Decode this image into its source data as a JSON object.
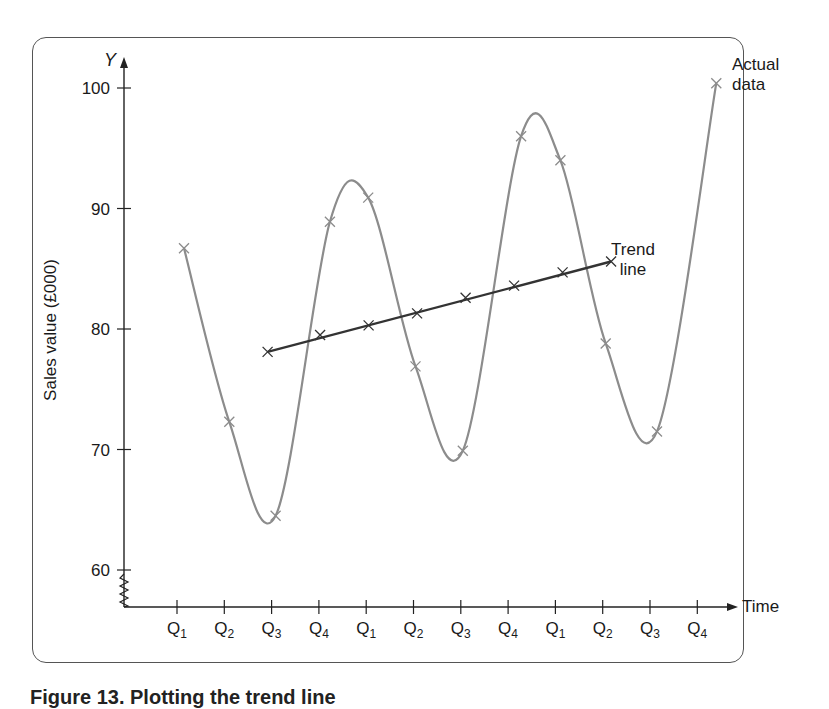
{
  "chart_data": {
    "type": "line",
    "title": "",
    "xlabel": "Time",
    "ylabel": "Sales value (£000)",
    "y_axis_symbol": "Y",
    "ylim": [
      57,
      102
    ],
    "yticks": [
      60,
      70,
      80,
      90,
      100
    ],
    "y_axis_break": true,
    "categories": [
      "Q1",
      "Q2",
      "Q3",
      "Q4",
      "Q1",
      "Q2",
      "Q3",
      "Q4",
      "Q1",
      "Q2",
      "Q3",
      "Q4"
    ],
    "grid": false,
    "series": [
      {
        "name": "Actual data",
        "style": "smooth curve with x markers",
        "color": "#8c8c8c",
        "values": [
          86.7,
          72.3,
          64.5,
          88.9,
          90.9,
          76.9,
          69.9,
          96.0,
          94.0,
          78.8,
          71.5,
          100.4
        ]
      },
      {
        "name": "Trend line",
        "style": "straight line with x markers",
        "color": "#333333",
        "start_index": 2,
        "values": [
          null,
          null,
          78.1,
          79.5,
          80.3,
          81.3,
          82.6,
          83.6,
          84.7,
          85.6,
          null,
          null
        ]
      }
    ],
    "annotations": [
      {
        "text": "Actual data",
        "near": "last actual data point (Q4, ~100)"
      },
      {
        "text": "Trend line",
        "near": "end of trend line (Q2, ~85.6)"
      }
    ],
    "legend": "none (inline annotations)"
  },
  "labels": {
    "y_symbol": "Y",
    "y_title": "Sales value (£000)",
    "x_title": "Time",
    "actual_1": "Actual",
    "actual_2": "data",
    "trend_1": "Trend",
    "trend_2": "line",
    "caption": "Figure 13.  Plotting the trend line"
  }
}
